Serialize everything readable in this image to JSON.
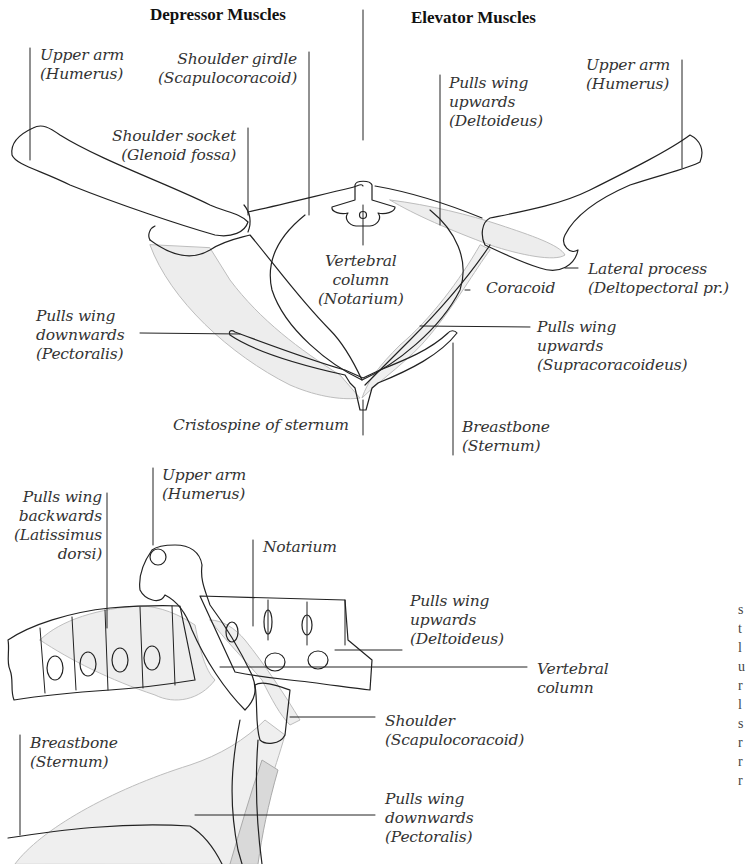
{
  "headers": {
    "depressor": "Depressor Muscles",
    "elevator": "Elevator Muscles"
  },
  "front_view": {
    "labels": {
      "upper_arm_left": "Upper arm\n(Humerus)",
      "shoulder_girdle": "Shoulder girdle\n(Scapulocoracoid)",
      "shoulder_socket": "Shoulder socket\n(Glenoid fossa)",
      "pulls_up_deltoideus": "Pulls wing\nupwards\n(Deltoideus)",
      "upper_arm_right": "Upper arm\n(Humerus)",
      "vertebral_column": "Vertebral\ncolumn\n(Notarium)",
      "lateral_process": "Lateral process\n(Deltopectoral pr.)",
      "coracoid": "Coracoid",
      "pulls_down_pectoralis": "Pulls wing\ndownwards\n(Pectoralis)",
      "pulls_up_supracoracoideus": "Pulls wing\nupwards\n(Supracoracoideus)",
      "cristospine": "Cristospine of sternum",
      "breastbone": "Breastbone\n(Sternum)"
    }
  },
  "side_view": {
    "labels": {
      "upper_arm": "Upper arm\n(Humerus)",
      "pulls_back_latissimus": "Pulls wing\nbackwards\n(Latissimus\ndorsi)",
      "notarium": "Notarium",
      "pulls_up_deltoideus": "Pulls wing\nupwards\n(Deltoideus)",
      "vertebral_column": "Vertebral\ncolumn",
      "shoulder": "Shoulder\n(Scapulocoracoid)",
      "breastbone": "Breastbone\n(Sternum)",
      "pulls_down_pectoralis": "Pulls wing\ndownwards\n(Pectoralis)"
    }
  },
  "colors": {
    "line": "#222222",
    "muscle_fill": "#ececec",
    "muscle_stroke": "#b8b8b8"
  }
}
